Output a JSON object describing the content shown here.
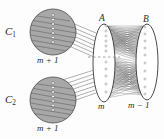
{
  "figure": {
    "type": "graph-theory-diagram",
    "background_color": "#fdfdfd",
    "ink_color": "#2b2b2b",
    "clique_fill_color": "#a8a8a8",
    "clique_stroke_color": "#4a4a4a",
    "vertex_color": "#ffffff",
    "edge_color": "#555555"
  },
  "cliques": [
    {
      "name": "C1",
      "label": "C",
      "subscript": "1",
      "size_label": "m + 1",
      "vertex_count": 7,
      "cx": 53,
      "cy": 32,
      "r": 23
    },
    {
      "name": "C2",
      "label": "C",
      "subscript": "2",
      "size_label": "m + 1",
      "vertex_count": 7,
      "cx": 53,
      "cy": 100,
      "r": 23
    }
  ],
  "sets": [
    {
      "name": "A",
      "label": "A",
      "size_label": "m",
      "vertex_count": 11,
      "cx": 104,
      "cy": 63,
      "rx": 11,
      "ry": 39
    },
    {
      "name": "B",
      "label": "B",
      "size_label": "m − 1",
      "vertex_count": 10,
      "cx": 147,
      "cy": 62,
      "rx": 11,
      "ry": 38
    }
  ],
  "labels": {
    "c1": "C",
    "c1_sub": "1",
    "c1_size": "m + 1",
    "c2": "C",
    "c2_sub": "2",
    "c2_size": "m + 1",
    "a": "A",
    "a_size": "m",
    "b": "B",
    "b_size": "m − 1"
  },
  "connections": {
    "c1_to_a": {
      "from": "C1",
      "to": "A",
      "style": "bundle-of-lines",
      "count": 7
    },
    "c2_to_a": {
      "from": "C2",
      "to": "A",
      "style": "bundle-of-lines",
      "count": 7
    },
    "a_to_b": {
      "from": "A",
      "to": "B",
      "style": "complete-bipartite-mesh"
    }
  },
  "ellipsis": {
    "present": true,
    "style": "horizontal-dashed",
    "at": "middle-of-A"
  }
}
